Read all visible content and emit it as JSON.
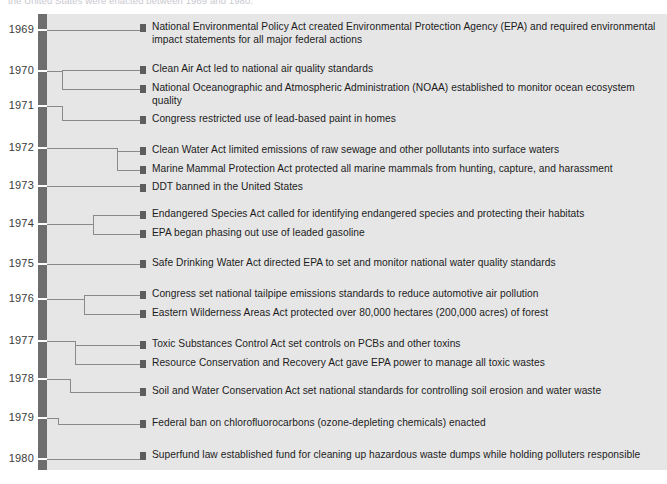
{
  "caption": "the United States were enacted between 1969 and 1980.",
  "colors": {
    "panel_bg": "#e6e6e6",
    "spine": "#6e6e6e",
    "connector": "#8a8a8a",
    "bullet": "#5d5d5d",
    "text": "#1c1c1c",
    "year_text": "#3a3a3a"
  },
  "years": [
    {
      "label": "1969",
      "y": 30
    },
    {
      "label": "1970",
      "y": 71
    },
    {
      "label": "1971",
      "y": 106
    },
    {
      "label": "1972",
      "y": 148
    },
    {
      "label": "1973",
      "y": 186
    },
    {
      "label": "1974",
      "y": 224
    },
    {
      "label": "1975",
      "y": 264
    },
    {
      "label": "1976",
      "y": 299
    },
    {
      "label": "1977",
      "y": 341
    },
    {
      "label": "1978",
      "y": 379
    },
    {
      "label": "1979",
      "y": 418
    },
    {
      "label": "1980",
      "y": 459
    }
  ],
  "events": [
    {
      "year": "1969",
      "y": 28,
      "text": "National Environmental Policy Act created Environmental Protection Agency (EPA)  and required environmental impact statements for all major federal actions"
    },
    {
      "year": "1970",
      "y": 70,
      "text": "Clean Air Act led to national air quality standards"
    },
    {
      "year": "1970",
      "y": 89,
      "text": "National Oceanographic and Atmospheric Administration (NOAA) established to monitor ocean ecosystem quality"
    },
    {
      "year": "1971",
      "y": 120,
      "text": "Congress restricted use of lead-based paint in homes"
    },
    {
      "year": "1972",
      "y": 151,
      "text": "Clean Water Act limited emissions of raw sewage and other pollutants into surface waters"
    },
    {
      "year": "1972",
      "y": 170,
      "text": "Marine Mammal Protection Act protected all marine mammals from hunting, capture, and harassment"
    },
    {
      "year": "1973",
      "y": 188,
      "text": "DDT banned in the United States"
    },
    {
      "year": "1974",
      "y": 215,
      "text": "Endangered Species Act called for identifying endangered species and protecting their habitats"
    },
    {
      "year": "1974",
      "y": 234,
      "text": "EPA began phasing out use of leaded gasoline"
    },
    {
      "year": "1975",
      "y": 264,
      "text": "Safe Drinking Water Act directed EPA to set and monitor national water quality standards"
    },
    {
      "year": "1976",
      "y": 295,
      "text": "Congress set national tailpipe emissions standards to reduce automotive air pollution"
    },
    {
      "year": "1976",
      "y": 314,
      "text": "Eastern Wilderness Areas Act protected over 80,000 hectares (200,000 acres) of forest"
    },
    {
      "year": "1977",
      "y": 345,
      "text": "Toxic Substances Control Act set controls on PCBs and other toxins"
    },
    {
      "year": "1977",
      "y": 364,
      "text": "Resource Conservation and Recovery Act gave EPA power to manage all toxic wastes"
    },
    {
      "year": "1978",
      "y": 392,
      "text": "Soil and Water Conservation Act set national standards for controlling soil erosion and water waste"
    },
    {
      "year": "1979",
      "y": 424,
      "text": "Federal ban on chlorofluorocarbons (ozone-depleting chemicals) enacted"
    },
    {
      "year": "1980",
      "y": 456,
      "text": "Superfund law established fund for cleaning up hazardous waste dumps while holding polluters responsible"
    }
  ],
  "connectors": {
    "note": "elbow routing from spine to each bullet",
    "bullet_x": 140,
    "spine_right": 47
  }
}
